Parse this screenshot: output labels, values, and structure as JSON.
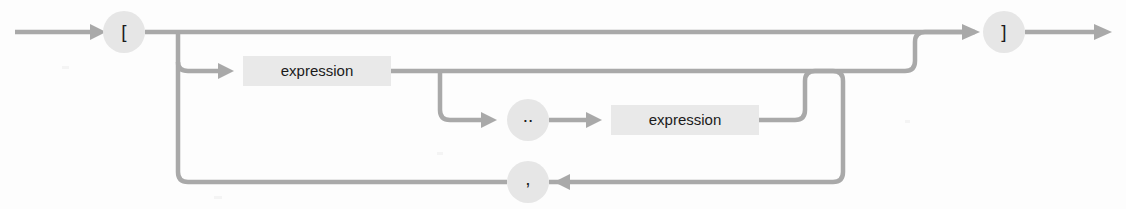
{
  "diagram": {
    "kind": "railroad-syntax-diagram",
    "colors": {
      "rail": "#a9a9a9",
      "node_fill": "#e6e6e6",
      "box_fill": "#e9e9e9",
      "text": "#1b1b1b",
      "background": "#fdfdfd"
    },
    "entry": {
      "label": "entry-arrow",
      "x": 15,
      "y": 32
    },
    "exit": {
      "label": "exit-arrow",
      "x": 1110,
      "y": 32
    },
    "nodes": [
      {
        "id": "open-bracket",
        "type": "terminal",
        "label": "[",
        "shape": "circle",
        "cx": 124,
        "cy": 32,
        "r": 21
      },
      {
        "id": "expression-1",
        "type": "nonterminal",
        "label": "expression",
        "shape": "rect",
        "x": 243,
        "y": 56,
        "width": 148,
        "height": 30
      },
      {
        "id": "range-operator",
        "type": "terminal",
        "label": "..",
        "shape": "circle",
        "cx": 528,
        "cy": 120,
        "r": 21
      },
      {
        "id": "expression-2",
        "type": "nonterminal",
        "label": "expression",
        "shape": "rect",
        "x": 611,
        "y": 105,
        "width": 148,
        "height": 30
      },
      {
        "id": "comma-separator",
        "type": "terminal",
        "label": ",",
        "shape": "circle",
        "cx": 528,
        "cy": 182,
        "r": 21
      },
      {
        "id": "close-bracket",
        "type": "terminal",
        "label": "]",
        "shape": "circle",
        "cx": 1004,
        "cy": 32,
        "r": 21
      }
    ],
    "paths": [
      {
        "id": "entry-to-open",
        "from": "entry",
        "to": "open-bracket"
      },
      {
        "id": "bypass-main",
        "from": "open-bracket",
        "to": "close-bracket"
      },
      {
        "id": "open-to-expression-1",
        "from": "open-bracket",
        "to": "expression-1"
      },
      {
        "id": "expression-1-to-close",
        "from": "expression-1",
        "to": "close-bracket"
      },
      {
        "id": "expression-1-to-range",
        "from": "expression-1",
        "to": "range-operator"
      },
      {
        "id": "range-to-expression-2",
        "from": "range-operator",
        "to": "expression-2"
      },
      {
        "id": "expression-2-to-join",
        "from": "expression-2",
        "to": "expression-1-to-close"
      },
      {
        "id": "loop-back-comma",
        "from": "expression-2-to-join",
        "to": "comma-separator"
      },
      {
        "id": "comma-to-expression-1",
        "from": "comma-separator",
        "to": "open-to-expression-1"
      },
      {
        "id": "close-to-exit",
        "from": "close-bracket",
        "to": "exit"
      }
    ]
  }
}
